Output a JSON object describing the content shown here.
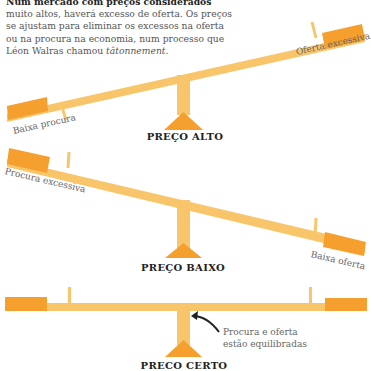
{
  "intro": {
    "heading": "Num mercado com preços considerados",
    "body_pre": "muito altos, haverá excesso de oferta. Os preços se ajustam para eliminar os excessos na oferta ou na procura na economia, num processo que Léon Walras chamou ",
    "body_italic": "tâtonnement",
    "body_post": "."
  },
  "colors": {
    "beam": "#f9c56b",
    "block": "#f5a02e",
    "fulcrum": "#f5a02e",
    "text": "#666666",
    "title": "#222222"
  },
  "seesaws": [
    {
      "label": "PREÇO ALTO",
      "left_text": "Baixa procura",
      "right_text": "Oferta excessiva"
    },
    {
      "label": "PREÇO BAIXO",
      "left_text": "Procura excessiva",
      "right_text": "Baixa oferta"
    },
    {
      "label": "PRECO CERTO",
      "note_line1": "Procura e oferta",
      "note_line2": "estão equilibradas"
    }
  ]
}
